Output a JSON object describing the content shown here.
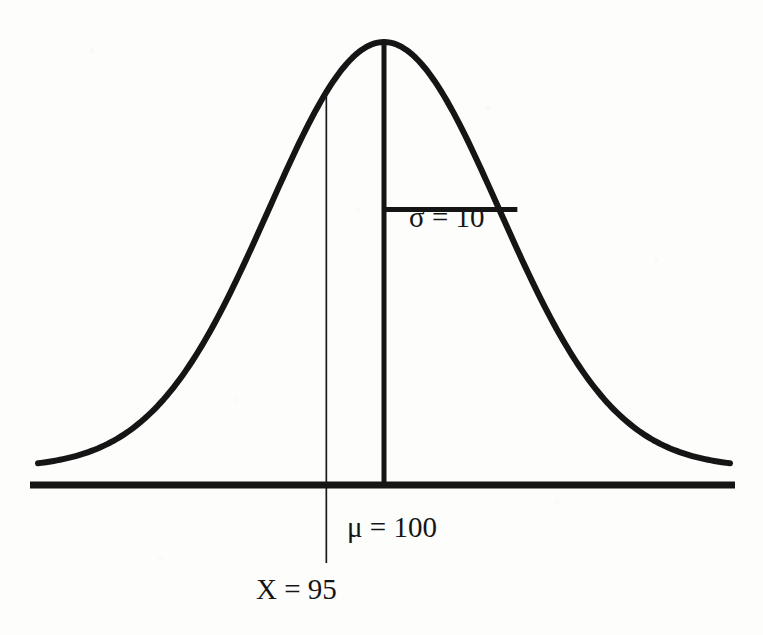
{
  "figure": {
    "background_color": "#fdfdfc",
    "ink_color": "#151515",
    "labels": {
      "sigma": "σ = 10",
      "mu": "μ = 100",
      "x_value": "X = 95"
    }
  },
  "chart_data": {
    "type": "line",
    "title": "",
    "subtitle": "",
    "xlabel": "",
    "ylabel": "",
    "grid": false,
    "legend_position": "none",
    "distribution": {
      "name": "normal",
      "mean": 100,
      "mean_symbol": "μ",
      "mean_label": "μ = 100",
      "std_dev": 10,
      "std_dev_symbol": "σ",
      "std_dev_label": "σ = 10",
      "marked_x": 95,
      "marked_x_label": "X = 95",
      "z_score": -0.5
    },
    "axis_range_x": [
      70,
      130
    ],
    "series": [
      {
        "name": "normal-density",
        "x": [
          70,
          74,
          78,
          82,
          86,
          90,
          94,
          98,
          100,
          102,
          106,
          110,
          114,
          118,
          122,
          126,
          130
        ],
        "y": [
          0.0044,
          0.0136,
          0.0332,
          0.079,
          0.1736,
          0.3247,
          0.5399,
          0.8521,
          1.0,
          0.8521,
          0.5399,
          0.3247,
          0.1736,
          0.079,
          0.0332,
          0.0136,
          0.0044
        ]
      }
    ],
    "annotations": [
      {
        "name": "mean-line",
        "type": "vline",
        "x": 100,
        "label": "μ = 100",
        "style": "thick"
      },
      {
        "name": "x-value-line",
        "type": "vline",
        "x": 95,
        "label": "X = 95",
        "style": "thin"
      },
      {
        "name": "sigma-segment",
        "type": "hsegment",
        "x_start": 100,
        "x_end": 110,
        "y": 0.6065,
        "label": "σ = 10",
        "style": "thick"
      },
      {
        "name": "baseline-axis",
        "type": "hline",
        "y": 0,
        "style": "thick"
      }
    ]
  }
}
